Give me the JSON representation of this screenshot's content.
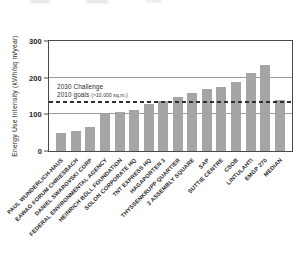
{
  "chart_data": {
    "type": "bar",
    "title": "",
    "xlabel": "",
    "ylabel": "Energy Use Intensity (kWh/sq m/year)",
    "ylim": [
      0,
      300
    ],
    "yticks": [
      0,
      100,
      200,
      300
    ],
    "gridline_values": [
      100,
      200
    ],
    "grid": true,
    "legend": false,
    "bar_color": "#a5a5a5",
    "categories": [
      "PAUL WUNDERLICH-HAUS",
      "EAWAG FORUM CHRIESBACH",
      "DANIEL SWAROVSKI CORP",
      "FEDERAL ENVIRONMENTAL AGENCY",
      "HEINRICH BÖLL FOUNDATION",
      "SOLON CORPORATE HQ",
      "TNT EXPRESS HQ",
      "HAGAPORTEN 3",
      "THYSSENKRUPP QUARTIER",
      "3 ASSEMBLY SQUARE",
      "SAP",
      "SUTTIE CENTRE",
      "CSOB",
      "LINTULAHTI",
      "EMGP 270",
      "MEDIAN"
    ],
    "values": [
      50,
      54,
      66,
      100,
      107,
      113,
      129,
      137,
      148,
      159,
      170,
      174,
      187,
      214,
      234,
      140
    ],
    "reference_line": {
      "value": 130,
      "style": "dashed",
      "color": "#2e2e2e",
      "label_line1": "2030 Challenge",
      "label_line2": "2010 goals",
      "label_note": "(>10,000 sq.m.)"
    }
  }
}
